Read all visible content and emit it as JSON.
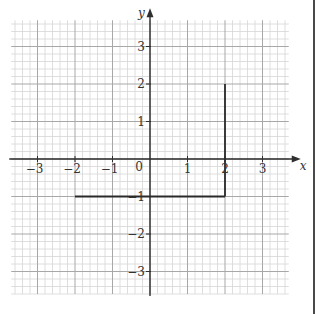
{
  "chart_data": {
    "type": "line",
    "title": "",
    "xlabel": "x",
    "ylabel": "y",
    "xlim": [
      -3.7,
      3.7
    ],
    "ylim": [
      -3.6,
      3.7
    ],
    "grid": true,
    "minor_grid_step": 0.2,
    "major_grid_step": 1,
    "x_ticks": [
      -3,
      -2,
      -1,
      0,
      1,
      2,
      3
    ],
    "x_tick_labels": [
      "−3",
      "−2",
      "−1",
      "0",
      "1",
      "2",
      "3"
    ],
    "y_ticks": [
      3,
      2,
      1,
      -1,
      -2,
      -3
    ],
    "y_tick_labels": [
      "3",
      "2",
      "1",
      "−1",
      "−2",
      "−3"
    ],
    "origin_label": "0",
    "series": [
      {
        "name": "boundary-lines",
        "segments": [
          {
            "label": "horizontal line y = -1",
            "points": [
              [
                -2,
                -1
              ],
              [
                2,
                -1
              ]
            ]
          },
          {
            "label": "vertical line x = 2",
            "points": [
              [
                2,
                -1
              ],
              [
                2,
                2
              ]
            ]
          }
        ],
        "color": "#2a2a2a"
      }
    ],
    "legend": null
  },
  "colors": {
    "axis": "#2f2f2f",
    "line": "#2a2a2a",
    "grid_minor": "#d6d6d6",
    "grid_major": "#a8a8a8",
    "border": "#4a4a4a"
  }
}
